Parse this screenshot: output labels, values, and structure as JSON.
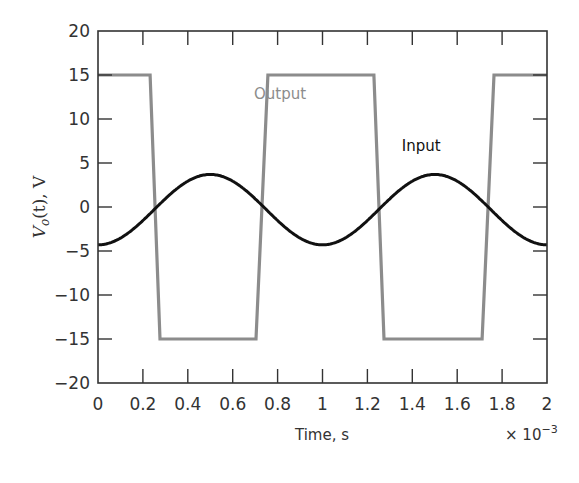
{
  "chart_data": {
    "type": "line",
    "title": "",
    "xlabel": "Time, s",
    "x_multiplier": "× 10",
    "x_multiplier_exp": "−3",
    "ylabel_main": "V",
    "ylabel_sub": "o",
    "ylabel_rest": "(t), V",
    "xlim": [
      0,
      2
    ],
    "ylim": [
      -20,
      20
    ],
    "x_ticks": [
      0,
      0.2,
      0.4,
      0.6,
      0.8,
      1,
      1.2,
      1.4,
      1.6,
      1.8,
      2
    ],
    "x_tick_labels": [
      "0",
      "0.2",
      "0.4",
      "0.6",
      "0.8",
      "1",
      "1.2",
      "1.4",
      "1.6",
      "1.8",
      "2"
    ],
    "y_ticks": [
      20,
      15,
      10,
      5,
      0,
      -5,
      -10,
      -15,
      -20
    ],
    "y_tick_labels": [
      "20",
      "15",
      "10",
      "5",
      "0",
      "−5",
      "−10",
      "−15",
      "−20"
    ],
    "grid": false,
    "legend": "inline labels",
    "series": [
      {
        "name": "Output",
        "color": "#8c8c8c",
        "label_pos": [
          0.82,
          12.8
        ],
        "x": [
          0,
          0.232,
          0.276,
          0.704,
          0.757,
          1.229,
          1.274,
          1.711,
          1.764,
          2.0
        ],
        "values": [
          15,
          15,
          -15,
          -15,
          15,
          15,
          -15,
          -15,
          15,
          15
        ]
      },
      {
        "name": "Input",
        "color": "#111111",
        "label_pos": [
          1.44,
          6.9
        ],
        "formula": "-0.3 - 4*cos(2*pi*t)",
        "x": [
          0,
          0.1,
          0.2,
          0.3,
          0.4,
          0.5,
          0.6,
          0.7,
          0.8,
          0.9,
          1.0,
          1.1,
          1.2,
          1.3,
          1.4,
          1.5,
          1.6,
          1.7,
          1.8,
          1.9,
          2.0
        ],
        "values": [
          -4.3,
          -3.54,
          -1.54,
          0.94,
          2.94,
          3.7,
          2.94,
          0.94,
          -1.54,
          -3.54,
          -4.3,
          -3.54,
          -1.54,
          0.94,
          2.94,
          3.7,
          2.94,
          0.94,
          -1.54,
          -3.54,
          -4.3
        ]
      }
    ]
  }
}
